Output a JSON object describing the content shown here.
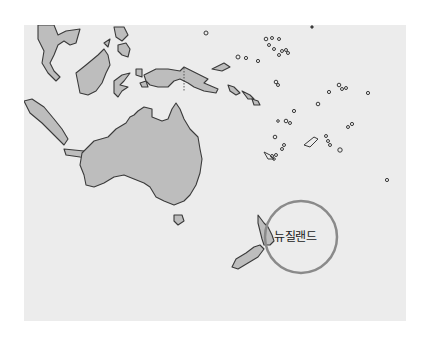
{
  "map": {
    "region": "Oceania",
    "highlight_label": "뉴질랜드",
    "colors": {
      "background": "#ececec",
      "land": "#bdbdbd",
      "outline": "#3a3a3a",
      "highlight_circle": "#8a8a8a"
    }
  }
}
